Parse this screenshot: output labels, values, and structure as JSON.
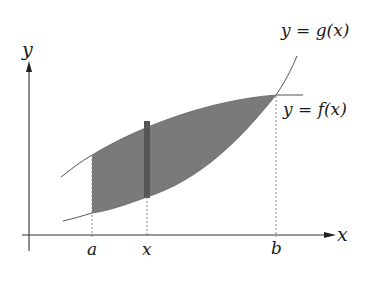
{
  "diagram": {
    "title": "",
    "axes": {
      "x_label": "x",
      "y_label": "y"
    },
    "ticks": [
      {
        "label": "a",
        "px": 92
      },
      {
        "label": "x",
        "px": 147
      },
      {
        "label": "b",
        "px": 276
      }
    ],
    "curves": [
      {
        "name": "g",
        "label_lhs": "y = ",
        "label_fn": "g(x)",
        "description": "lower-left, crosses at b and rises steeply"
      },
      {
        "name": "f",
        "label_lhs": "y = ",
        "label_fn": "f(x)",
        "description": "upper curve between a and b, levels off"
      }
    ],
    "region": {
      "description": "shaded region between f(x) and g(x) from a to b",
      "fill_color": "#7a7a7a"
    },
    "strip": {
      "description": "vertical strip at x",
      "fill_color": "#555555"
    },
    "colors": {
      "axis": "#333333",
      "curve": "#555555",
      "dashed": "#888888",
      "shade": "#7a7a7a",
      "strip": "#555555"
    }
  }
}
